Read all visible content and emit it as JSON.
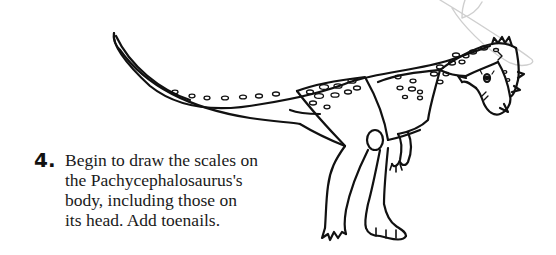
{
  "step": {
    "number": "4.",
    "lines": [
      "Begin to draw the scales on",
      "the Pachycephalosaurus's",
      "body, including those on",
      "its head. Add toenails."
    ]
  },
  "illustration": {
    "subject": "Pachycephalosaurus",
    "line_color": "#111111",
    "guide_line_color": "#c8c8c8"
  }
}
